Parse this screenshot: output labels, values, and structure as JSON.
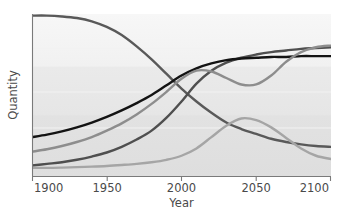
{
  "chart_data": {
    "type": "line",
    "title": "",
    "xlabel": "Year",
    "ylabel": "Quantity",
    "xlim": [
      1900,
      2100
    ],
    "ylim": [
      0,
      100
    ],
    "grid": true,
    "legend": "none",
    "xticks": [
      1900,
      1950,
      2000,
      2050,
      2100
    ],
    "xticklabels": [
      "1900",
      "1950",
      "2000",
      "2050",
      "2100"
    ],
    "yticks": [],
    "yticklabels": [],
    "x": [
      1900,
      1910,
      1920,
      1930,
      1940,
      1950,
      1960,
      1970,
      1980,
      1990,
      2000,
      2010,
      2020,
      2030,
      2040,
      2050,
      2060,
      2070,
      2080,
      2090,
      2100
    ],
    "series": [
      {
        "name": "declining-dark-gray",
        "color": "#595959",
        "width": 2.4,
        "values": [
          99,
          99,
          98.5,
          97.5,
          95.5,
          92,
          87,
          80,
          72,
          63,
          54,
          46,
          39,
          33,
          29,
          26,
          23,
          21,
          19.5,
          18.5,
          18
        ]
      },
      {
        "name": "rising-dark-gray",
        "color": "#4f4f4f",
        "width": 2.4,
        "values": [
          6.5,
          7.5,
          8.5,
          10,
          12,
          14.5,
          18,
          22.5,
          28,
          36,
          46,
          57,
          65,
          70,
          73,
          75,
          76.5,
          77.5,
          78.5,
          79,
          79.5
        ]
      },
      {
        "name": "rising-black",
        "color": "#131313",
        "width": 2.4,
        "values": [
          24,
          25.5,
          27.5,
          30,
          33,
          36.5,
          40.5,
          45,
          50,
          56,
          62,
          66.5,
          69.5,
          71.5,
          72.5,
          73,
          73.5,
          73.5,
          74,
          74,
          74
        ]
      },
      {
        "name": "rising-mid-gray-dip",
        "color": "#8d8d8d",
        "width": 2.4,
        "values": [
          15,
          16.5,
          18.5,
          21,
          24,
          28,
          32.5,
          38,
          44.5,
          52,
          60,
          65,
          64.5,
          60.5,
          56.5,
          56.5,
          62,
          70.5,
          76.5,
          79.5,
          80.5
        ]
      },
      {
        "name": "hump-light-gray",
        "color": "#a5a5a5",
        "width": 2.4,
        "values": [
          5,
          5,
          5.2,
          5.5,
          5.8,
          6.2,
          6.8,
          7.5,
          8.5,
          10,
          12.5,
          17,
          24,
          31,
          35.5,
          34.5,
          30,
          23.5,
          17,
          12.5,
          10.5
        ]
      }
    ]
  },
  "axes": {
    "xlabel": "Year",
    "ylabel": "Quantity"
  }
}
